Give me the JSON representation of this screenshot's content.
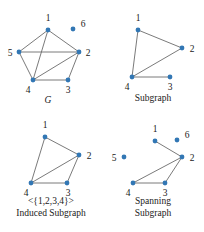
{
  "figure": {
    "background": "#ffffff",
    "vertex_color": "#3277b4",
    "edge_color": "#6b6b6b",
    "label_color": "#1a1a1a"
  },
  "panels": [
    {
      "id": "g",
      "caption": "G",
      "caption_style": "italic",
      "caption_lines": [
        "G"
      ],
      "vertices": [
        {
          "id": "1",
          "label": "1",
          "x": 48,
          "y": 30,
          "label_x": 48,
          "label_y": 21,
          "label_anchor": "middle"
        },
        {
          "id": "2",
          "label": "2",
          "x": 79,
          "y": 52,
          "label_x": 88,
          "label_y": 56,
          "label_anchor": "middle"
        },
        {
          "id": "3",
          "label": "3",
          "x": 68,
          "y": 80,
          "label_x": 68,
          "label_y": 93,
          "label_anchor": "middle"
        },
        {
          "id": "4",
          "label": "4",
          "x": 33,
          "y": 80,
          "label_x": 28,
          "label_y": 93,
          "label_anchor": "middle"
        },
        {
          "id": "5",
          "label": "5",
          "x": 19,
          "y": 52,
          "label_x": 10,
          "label_y": 56,
          "label_anchor": "middle"
        },
        {
          "id": "6",
          "label": "6",
          "x": 73,
          "y": 29,
          "label_x": 83,
          "label_y": 27,
          "label_anchor": "middle"
        }
      ],
      "edges": [
        [
          "1",
          "5"
        ],
        [
          "1",
          "2"
        ],
        [
          "1",
          "4"
        ],
        [
          "5",
          "2"
        ],
        [
          "5",
          "4"
        ],
        [
          "2",
          "4"
        ],
        [
          "2",
          "3"
        ],
        [
          "4",
          "3"
        ]
      ]
    },
    {
      "id": "subgraph",
      "caption": "Subgraph",
      "caption_style": "normal",
      "caption_lines": [
        "Subgraph"
      ],
      "vertices": [
        {
          "id": "1",
          "label": "1",
          "x": 36,
          "y": 30,
          "label_x": 36,
          "label_y": 21,
          "label_anchor": "middle"
        },
        {
          "id": "2",
          "label": "2",
          "x": 80,
          "y": 48,
          "label_x": 90,
          "label_y": 52,
          "label_anchor": "middle"
        },
        {
          "id": "3",
          "label": "3",
          "x": 68,
          "y": 77,
          "label_x": 68,
          "label_y": 90,
          "label_anchor": "middle"
        },
        {
          "id": "4",
          "label": "4",
          "x": 30,
          "y": 77,
          "label_x": 25,
          "label_y": 90,
          "label_anchor": "middle"
        }
      ],
      "edges": [
        [
          "1",
          "2"
        ],
        [
          "1",
          "4"
        ],
        [
          "2",
          "4"
        ],
        [
          "4",
          "3"
        ]
      ]
    },
    {
      "id": "induced",
      "caption": "<{1,2,3,4}> Induced Subgraph",
      "caption_style": "normal",
      "caption_lines": [
        "<{1,2,3,4}>",
        "Induced Subgraph"
      ],
      "vertices": [
        {
          "id": "1",
          "label": "1",
          "x": 45,
          "y": 21,
          "label_x": 45,
          "label_y": 12,
          "label_anchor": "middle"
        },
        {
          "id": "2",
          "label": "2",
          "x": 79,
          "y": 39,
          "label_x": 89,
          "label_y": 43,
          "label_anchor": "middle"
        },
        {
          "id": "3",
          "label": "3",
          "x": 67,
          "y": 67,
          "label_x": 68,
          "label_y": 80,
          "label_anchor": "middle"
        },
        {
          "id": "4",
          "label": "4",
          "x": 31,
          "y": 67,
          "label_x": 26,
          "label_y": 80,
          "label_anchor": "middle"
        }
      ],
      "edges": [
        [
          "1",
          "2"
        ],
        [
          "1",
          "4"
        ],
        [
          "2",
          "4"
        ],
        [
          "2",
          "3"
        ],
        [
          "4",
          "3"
        ]
      ]
    },
    {
      "id": "spanning",
      "caption": "Spanning Subgraph",
      "caption_style": "normal",
      "caption_lines": [
        "Spanning",
        "Subgraph"
      ],
      "vertices": [
        {
          "id": "1",
          "label": "1",
          "x": 53,
          "y": 25,
          "label_x": 53,
          "label_y": 16,
          "label_anchor": "middle"
        },
        {
          "id": "2",
          "label": "2",
          "x": 80,
          "y": 41,
          "label_x": 90,
          "label_y": 45,
          "label_anchor": "middle"
        },
        {
          "id": "3",
          "label": "3",
          "x": 63,
          "y": 67,
          "label_x": 63,
          "label_y": 80,
          "label_anchor": "middle"
        },
        {
          "id": "4",
          "label": "4",
          "x": 31,
          "y": 67,
          "label_x": 26,
          "label_y": 80,
          "label_anchor": "middle"
        },
        {
          "id": "5",
          "label": "5",
          "x": 22,
          "y": 41,
          "label_x": 12,
          "label_y": 45,
          "label_anchor": "middle"
        },
        {
          "id": "6",
          "label": "6",
          "x": 75,
          "y": 24,
          "label_x": 85,
          "label_y": 22,
          "label_anchor": "middle"
        }
      ],
      "edges": [
        [
          "1",
          "2"
        ],
        [
          "2",
          "4"
        ],
        [
          "2",
          "3"
        ],
        [
          "4",
          "3"
        ]
      ]
    }
  ]
}
